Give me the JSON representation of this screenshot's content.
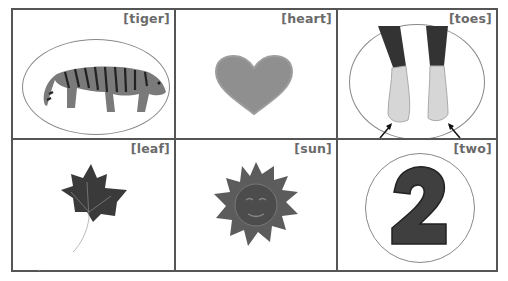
{
  "cards": [
    {
      "label": "[tiger]",
      "icon": "tiger-icon",
      "circled": true
    },
    {
      "label": "[heart]",
      "icon": "heart-icon",
      "circled": false
    },
    {
      "label": "[toes]",
      "icon": "feet-icon",
      "circled": true,
      "arrows": 2
    },
    {
      "label": "[leaf]",
      "icon": "leaf-icon",
      "circled": false
    },
    {
      "label": "[sun]",
      "icon": "sun-icon",
      "circled": false
    },
    {
      "label": "[two]",
      "icon": "number-two-icon",
      "circled": true,
      "numeral": "2"
    }
  ],
  "colors": {
    "border": "#555555",
    "label": "#6a6a6a",
    "oval": "#888888"
  }
}
